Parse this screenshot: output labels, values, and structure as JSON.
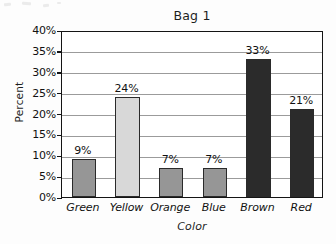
{
  "chart_data": {
    "type": "bar",
    "title": "Bag 1",
    "xlabel": "Color",
    "ylabel": "Percent",
    "categories": [
      "Green",
      "Yellow",
      "Orange",
      "Blue",
      "Brown",
      "Red"
    ],
    "values": [
      9,
      24,
      7,
      7,
      33,
      21
    ],
    "value_labels": [
      "9%",
      "24%",
      "7%",
      "7%",
      "33%",
      "21%"
    ],
    "bar_colors": [
      "#969696",
      "#d8d8d8",
      "#969696",
      "#969696",
      "#2b2b2b",
      "#2b2b2b"
    ],
    "bar_border_color": "#2a2a2a",
    "ylim": [
      0,
      40
    ],
    "ytick_values": [
      0,
      5,
      10,
      15,
      20,
      25,
      30,
      35,
      40
    ],
    "ytick_labels": [
      "0%",
      "5%",
      "10%",
      "15%",
      "20%",
      "25%",
      "30%",
      "35%",
      "40%"
    ],
    "grid": "horizontal",
    "gridline_color": "#9b9b9b",
    "axis_color": "#141414",
    "legend": "none",
    "background": "#ffffff"
  }
}
